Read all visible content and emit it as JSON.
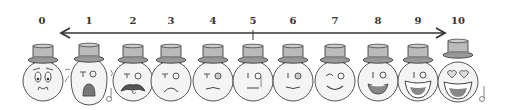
{
  "figure": {
    "title": "",
    "scale_labels": [
      "0",
      "1",
      "2",
      "3",
      "4",
      "5",
      "6",
      "7",
      "8",
      "9",
      "10"
    ],
    "arrow": {
      "direction": "bidirectional",
      "midpoint_tick": "5"
    },
    "faces": [
      {
        "level": "0",
        "expression": "worried"
      },
      {
        "level": "1",
        "expression": "crying-shocked"
      },
      {
        "level": "2",
        "expression": "angry-mustache-tongue"
      },
      {
        "level": "3",
        "expression": "frowning"
      },
      {
        "level": "4",
        "expression": "slightly-sad"
      },
      {
        "level": "5",
        "expression": "neutral"
      },
      {
        "level": "6",
        "expression": "slight-smile"
      },
      {
        "level": "7",
        "expression": "winking-smile"
      },
      {
        "level": "8",
        "expression": "smiling-grin"
      },
      {
        "level": "9",
        "expression": "big-grin"
      },
      {
        "level": "10",
        "expression": "heart-eyes-ecstatic"
      }
    ],
    "colors": {
      "ink": "#444444",
      "hat_fill": "#bbbbbb",
      "face_fill": "#f4f4f4",
      "mouth_fill": "#777777"
    }
  }
}
